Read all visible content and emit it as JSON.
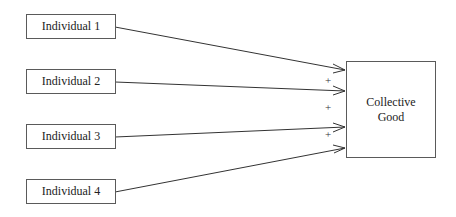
{
  "diagram": {
    "individuals": [
      {
        "label": "Individual 1"
      },
      {
        "label": "Individual 2"
      },
      {
        "label": "Individual 3"
      },
      {
        "label": "Individual 4"
      }
    ],
    "target": {
      "line1": "Collective",
      "line2": "Good"
    },
    "signs": [
      "+",
      "+",
      "+"
    ]
  }
}
